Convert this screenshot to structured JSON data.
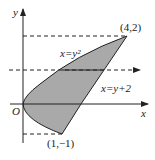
{
  "diagram": {
    "type": "region-between-curves",
    "axes": {
      "x_label": "x",
      "y_label": "y",
      "origin_label": "O"
    },
    "curves": [
      {
        "name": "parabola",
        "label": "x=y²",
        "equation": "x = y^2"
      },
      {
        "name": "line",
        "label": "x=y+2",
        "equation": "x = y + 2"
      }
    ],
    "points": [
      {
        "label": "(4,2)",
        "x": 4,
        "y": 2
      },
      {
        "label": "(1,−1)",
        "x": 1,
        "y": -1
      }
    ],
    "guides": [
      {
        "type": "dashed",
        "at_y": 2,
        "description": "horizontal dashed line y=2"
      },
      {
        "type": "dashed-arrow",
        "at_y": 1,
        "description": "horizontal dashed arrow across region"
      },
      {
        "type": "dashed",
        "at_y": -1,
        "description": "horizontal dashed line y=-1"
      }
    ],
    "region_fill": "#a9a9a9",
    "stroke": "#222222"
  }
}
